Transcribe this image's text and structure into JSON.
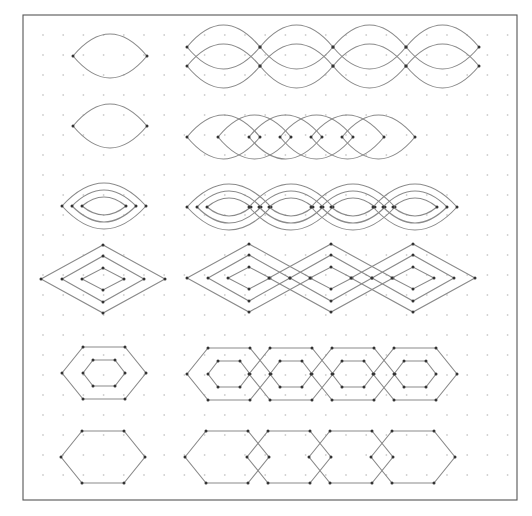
{
  "diagram": {
    "frame": {
      "x1": 23,
      "y1": 15,
      "x2": 517,
      "y2": 500
    },
    "grid": {
      "x0": 43,
      "y0": 35,
      "dx": 20.2,
      "dy": 20,
      "cols": 24,
      "rows": 24
    },
    "colors": {
      "frame": "#555555",
      "curve": "#8a8a8a",
      "vertex": "#333333",
      "grid_dot": "#cfcfcf"
    },
    "rows": [
      {
        "name": "double-lens",
        "type": "lens",
        "single": {
          "cx": 110,
          "cy": 56,
          "half_w": 37,
          "bulge": 22
        },
        "chain": {
          "start_x": 187,
          "y_top": 47,
          "y_bot": 66,
          "width": 73,
          "count": 4,
          "bulge": 22,
          "offset_rows": true
        }
      },
      {
        "name": "lens",
        "type": "lens",
        "single": {
          "cx": 110,
          "cy": 126,
          "half_w": 37,
          "bulge": 22
        },
        "chain": {
          "start_x": 187,
          "cy": 137,
          "width": 73,
          "step": 31,
          "count": 6,
          "bulge": 22
        }
      },
      {
        "name": "nested-lens",
        "type": "nested-lens",
        "single": {
          "cx": 104,
          "cy": 206,
          "half_ws": [
            42,
            32,
            22
          ],
          "bulges": [
            23,
            16,
            9
          ]
        },
        "chain": {
          "start_x": 187,
          "cy": 207,
          "spacing": 62,
          "count": 4
        }
      },
      {
        "name": "nested-diamond",
        "type": "nested-diamond",
        "single": {
          "cx": 103,
          "cy": 279,
          "sizes": [
            [
              62,
              34
            ],
            [
              41,
              23
            ],
            [
              21,
              11
            ]
          ]
        },
        "chain": {
          "start_x": 187,
          "cy": 278,
          "spacing": 82,
          "count": 3
        }
      },
      {
        "name": "nested-hexagon",
        "type": "nested-hexagon",
        "single": {
          "cx": 104,
          "cy": 373,
          "outer": [
            42,
            21,
            26
          ],
          "inner": [
            21,
            11,
            13
          ]
        },
        "chain": {
          "start_x": 187,
          "cy": 374,
          "spacing": 62,
          "count": 4
        }
      },
      {
        "name": "hexagon",
        "type": "hexagon",
        "single": {
          "cx": 103,
          "cy": 457,
          "outer": [
            42,
            21,
            26
          ]
        },
        "chain": {
          "start_x": 185,
          "cy": 457,
          "spacing": 62,
          "count": 4
        }
      }
    ]
  }
}
